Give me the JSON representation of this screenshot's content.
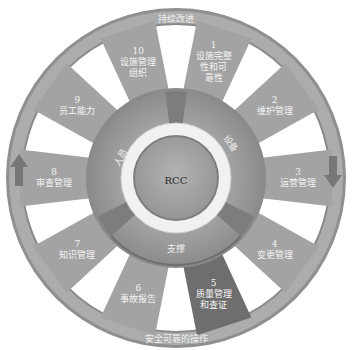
{
  "outer_ring": {
    "top_label": "持续改进",
    "bottom_label": "安全可靠的操作",
    "left_arrow": "arrow-up",
    "right_arrow": "arrow-down"
  },
  "spokes": [
    {
      "num": "1",
      "text": "设施完整性和可靠性",
      "lines": [
        "1",
        "设施完整",
        "性和可",
        "靠性"
      ],
      "highlighted": false
    },
    {
      "num": "2",
      "text": "维护管理",
      "lines": [
        "2",
        "维护管理"
      ],
      "highlighted": false
    },
    {
      "num": "3",
      "text": "运营管理",
      "lines": [
        "3",
        "运营管理"
      ],
      "highlighted": false
    },
    {
      "num": "4",
      "text": "变更管理",
      "lines": [
        "4",
        "变更管理"
      ],
      "highlighted": false
    },
    {
      "num": "5",
      "text": "质量管理和查证",
      "lines": [
        "5",
        "质量管理",
        "和查证"
      ],
      "highlighted": true
    },
    {
      "num": "6",
      "text": "事故报告",
      "lines": [
        "6",
        "事故报告"
      ],
      "highlighted": false
    },
    {
      "num": "7",
      "text": "知识管理",
      "lines": [
        "7",
        "知识管理"
      ],
      "highlighted": false
    },
    {
      "num": "8",
      "text": "审查管理",
      "lines": [
        "8",
        "审查管理"
      ],
      "highlighted": false
    },
    {
      "num": "9",
      "text": "员工能力",
      "lines": [
        "9",
        "员工能力"
      ],
      "highlighted": false
    },
    {
      "num": "10",
      "text": "设施管理组织",
      "lines": [
        "10",
        "设施管理",
        "组织"
      ],
      "highlighted": false
    }
  ],
  "inner_ring": {
    "segments": [
      {
        "label": "设备"
      },
      {
        "label": "支撑"
      },
      {
        "label": "人员"
      }
    ]
  },
  "center": {
    "label": "RCC"
  },
  "colors": {
    "outer_ring": "#a9a9a9",
    "spoke": "#a3a3a3",
    "spoke_highlight": "#6e6e6e",
    "inner_ring": "#9a9a9a",
    "inner_dark": "#7d7d7d",
    "white_ring": "#ececec",
    "center": "#a6a6a6",
    "arrow": "#7a7a7a"
  }
}
